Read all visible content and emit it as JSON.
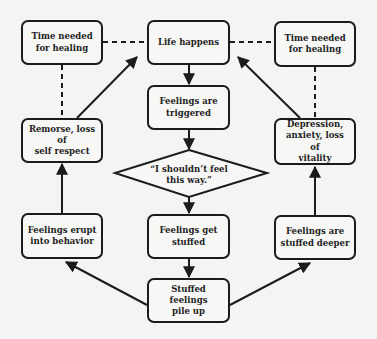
{
  "diagram": {
    "type": "flowchart-cycle",
    "nodes": {
      "life_happens": "Life happens",
      "feelings_triggered_1": "Feelings are",
      "feelings_triggered_2": "triggered",
      "decision_1": "“I shouldn’t feel",
      "decision_2": "this way.”",
      "feelings_stuffed_1": "Feelings get",
      "feelings_stuffed_2": "stuffed",
      "pile_up_1": "Stuffed feelings",
      "pile_up_2": "pile up",
      "erupt_1": "Feelings erupt",
      "erupt_2": "into behavior",
      "remorse_1": "Remorse, loss of",
      "remorse_2": "self respect",
      "time_left_1": "Time needed",
      "time_left_2": "for healing",
      "deeper_1": "Feelings are",
      "deeper_2": "stuffed deeper",
      "depression_1": "Depression,",
      "depression_2": "anxiety, loss of",
      "depression_3": "vitality",
      "time_right_1": "Time needed",
      "time_right_2": "for healing"
    },
    "edges": [
      {
        "from": "Life happens",
        "to": "Feelings are triggered",
        "style": "solid-arrow"
      },
      {
        "from": "Feelings are triggered",
        "to": "I shouldn't feel this way.",
        "style": "solid-arrow"
      },
      {
        "from": "I shouldn't feel this way.",
        "to": "Feelings get stuffed",
        "style": "solid-arrow"
      },
      {
        "from": "Feelings get stuffed",
        "to": "Stuffed feelings pile up",
        "style": "solid-arrow"
      },
      {
        "from": "Stuffed feelings pile up",
        "to": "Feelings erupt into behavior",
        "style": "solid-arrow"
      },
      {
        "from": "Feelings erupt into behavior",
        "to": "Remorse, loss of self respect",
        "style": "solid-arrow"
      },
      {
        "from": "Remorse, loss of self respect",
        "to": "Life happens",
        "style": "solid-arrow"
      },
      {
        "from": "Stuffed feelings pile up",
        "to": "Feelings are stuffed deeper",
        "style": "solid-arrow"
      },
      {
        "from": "Feelings are stuffed deeper",
        "to": "Depression, anxiety, loss of vitality",
        "style": "solid-arrow"
      },
      {
        "from": "Depression, anxiety, loss of vitality",
        "to": "Life happens",
        "style": "solid-arrow"
      },
      {
        "from": "Time needed for healing (left)",
        "to": "Life happens",
        "style": "dashed"
      },
      {
        "from": "Time needed for healing (left)",
        "to": "Remorse, loss of self respect",
        "style": "dashed"
      },
      {
        "from": "Time needed for healing (right)",
        "to": "Life happens",
        "style": "dashed"
      },
      {
        "from": "Time needed for healing (right)",
        "to": "Depression, anxiety, loss of vitality",
        "style": "dashed"
      }
    ]
  },
  "colors": {
    "background": "#f4f4f2",
    "stroke": "#1b1b1b",
    "text": "#1e1e1e"
  }
}
